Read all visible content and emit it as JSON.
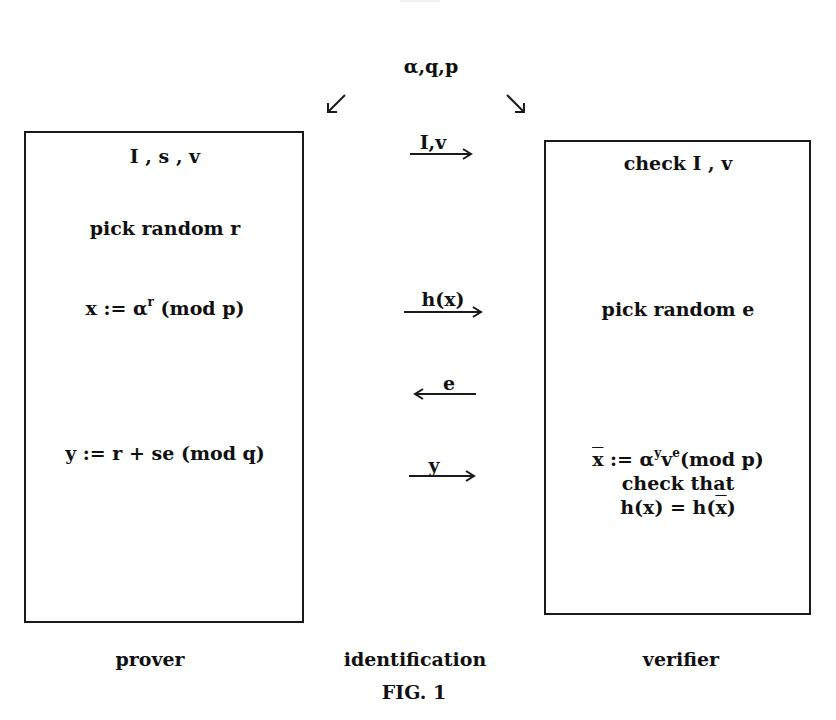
{
  "figure": {
    "params_label": "α,q,p",
    "caption": "FIG. 1"
  },
  "prover": {
    "title": "I , s , v",
    "step1": "pick random r",
    "step2_prefix": "x := α",
    "step2_sup": "r",
    "step2_suffix": " (mod p)",
    "step3": "y := r + se (mod q)",
    "label": "prover"
  },
  "verifier": {
    "title": "check I , v",
    "step1": "pick random e",
    "step2_xbar": "x",
    "step2_mid": " := α",
    "step2_sup1": "y",
    "step2_v": "v",
    "step2_sup2": "e",
    "step2_suffix": "(mod p)",
    "step3": "check that",
    "step4_prefix": "h(x) = h(",
    "step4_xbar": "x",
    "step4_suffix": ")",
    "label": "verifier"
  },
  "channel": {
    "label": "identification",
    "messages": [
      {
        "text": "I,v",
        "direction": "right"
      },
      {
        "text": "h(x)",
        "direction": "right"
      },
      {
        "text": "e",
        "direction": "left"
      },
      {
        "text": "y",
        "direction": "right"
      }
    ]
  },
  "colors": {
    "ink": "#1a1a1a",
    "background": "#ffffff"
  }
}
